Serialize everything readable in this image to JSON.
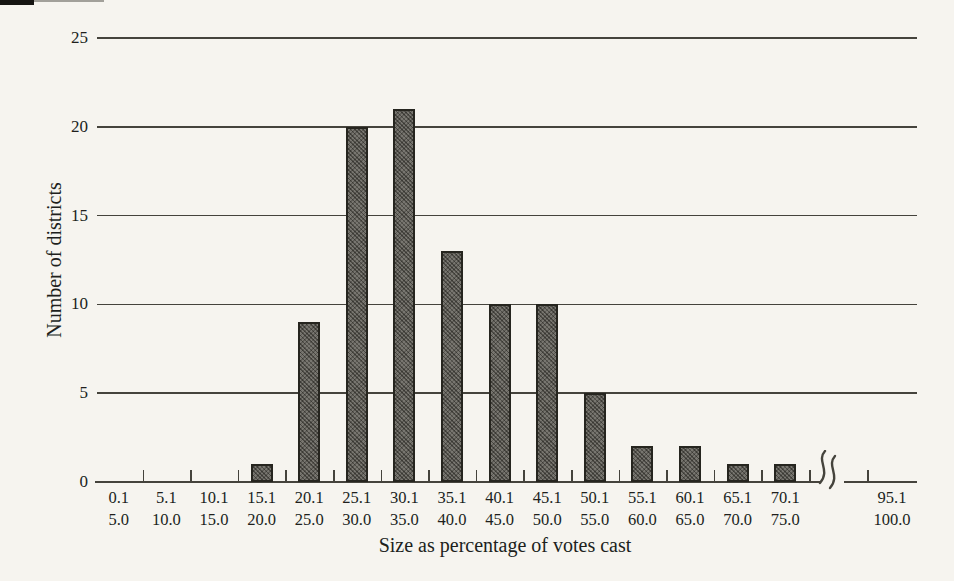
{
  "chart_data": {
    "type": "bar",
    "title": "",
    "xlabel": "Size as percentage of votes cast",
    "ylabel": "Number of districts",
    "ylim": [
      0,
      25
    ],
    "yticks": [
      0,
      5,
      10,
      15,
      20,
      25
    ],
    "grid": "horizontal",
    "legend": "none",
    "axis_break_between": [
      "70.1–75.0",
      "95.1–100.0"
    ],
    "bins": [
      {
        "label_top": "0.1",
        "label_bottom": "5.0",
        "value": 0
      },
      {
        "label_top": "5.1",
        "label_bottom": "10.0",
        "value": 0
      },
      {
        "label_top": "10.1",
        "label_bottom": "15.0",
        "value": 0
      },
      {
        "label_top": "15.1",
        "label_bottom": "20.0",
        "value": 1
      },
      {
        "label_top": "20.1",
        "label_bottom": "25.0",
        "value": 9
      },
      {
        "label_top": "25.1",
        "label_bottom": "30.0",
        "value": 20
      },
      {
        "label_top": "30.1",
        "label_bottom": "35.0",
        "value": 21
      },
      {
        "label_top": "35.1",
        "label_bottom": "40.0",
        "value": 13
      },
      {
        "label_top": "40.1",
        "label_bottom": "45.0",
        "value": 10
      },
      {
        "label_top": "45.1",
        "label_bottom": "50.0",
        "value": 10
      },
      {
        "label_top": "50.1",
        "label_bottom": "55.0",
        "value": 5
      },
      {
        "label_top": "55.1",
        "label_bottom": "60.0",
        "value": 2
      },
      {
        "label_top": "60.1",
        "label_bottom": "65.0",
        "value": 2
      },
      {
        "label_top": "65.1",
        "label_bottom": "70.0",
        "value": 1
      },
      {
        "label_top": "70.1",
        "label_bottom": "75.0",
        "value": 1
      },
      {
        "label_top": "95.1",
        "label_bottom": "100.0",
        "value": 0,
        "after_break": true
      }
    ],
    "colors": {
      "background": "#f6f4ef",
      "ink": "#201f1c",
      "line": "#45433c",
      "bar_fill": "#716f68",
      "bar_border": "#26251f"
    }
  }
}
